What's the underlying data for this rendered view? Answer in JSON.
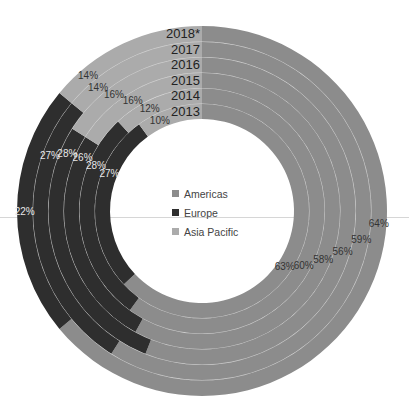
{
  "chart_data": {
    "type": "donut-multi-ring",
    "title": "",
    "rings_order": "inner-to-outer",
    "categories": [
      "2013",
      "2014",
      "2015",
      "2016",
      "2017",
      "2018*"
    ],
    "series": [
      {
        "name": "Americas",
        "color": "#8c8c8c",
        "values": [
          63,
          60,
          58,
          56,
          59,
          64
        ]
      },
      {
        "name": "Europe",
        "color": "#2e2e2e",
        "values": [
          27,
          28,
          26,
          28,
          27,
          22
        ]
      },
      {
        "name": "Asia Pacific",
        "color": "#ababab",
        "values": [
          10,
          12,
          16,
          16,
          14,
          14
        ]
      }
    ],
    "value_suffix": "%",
    "start_angle": "12 o'clock, clockwise",
    "legend_position": "center"
  },
  "legend": {
    "items": [
      {
        "label": "Americas",
        "color": "#8c8c8c"
      },
      {
        "label": "Europe",
        "color": "#2e2e2e"
      },
      {
        "label": "Asia Pacific",
        "color": "#ababab"
      }
    ]
  },
  "geometry": {
    "cx": 202,
    "cy": 211,
    "inner_r": 92,
    "ring_w": 15.5
  }
}
